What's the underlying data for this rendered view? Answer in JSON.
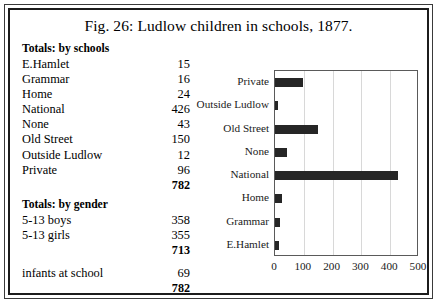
{
  "figure": {
    "title": "Fig. 26: Ludlow children in schools, 1877."
  },
  "tables": {
    "schools": {
      "heading": "Totals: by schools",
      "rows": [
        {
          "label": "E.Hamlet",
          "value": "15"
        },
        {
          "label": "Grammar",
          "value": "16"
        },
        {
          "label": "Home",
          "value": "24"
        },
        {
          "label": "National",
          "value": "426"
        },
        {
          "label": "None",
          "value": "43"
        },
        {
          "label": "Old Street",
          "value": "150"
        },
        {
          "label": "Outside Ludlow",
          "value": "12"
        },
        {
          "label": "Private",
          "value": "96"
        }
      ],
      "total": "782"
    },
    "gender": {
      "heading": "Totals: by gender",
      "rows": [
        {
          "label": "5-13 boys",
          "value": "358"
        },
        {
          "label": "5-13 girls",
          "value": "355"
        }
      ],
      "subtotal": "713",
      "extra_rows": [
        {
          "label": "infants at school",
          "value": "69"
        }
      ],
      "total": "782"
    }
  },
  "chart_data": {
    "type": "bar",
    "orientation": "horizontal",
    "title": "",
    "xlabel": "",
    "ylabel": "",
    "categories": [
      "E.Hamlet",
      "Grammar",
      "Home",
      "National",
      "None",
      "Old Street",
      "Outside Ludlow",
      "Private"
    ],
    "values": [
      15,
      16,
      24,
      426,
      43,
      150,
      12,
      96
    ],
    "category_order_top_to_bottom": [
      "Private",
      "Outside Ludlow",
      "Old Street",
      "None",
      "National",
      "Home",
      "Grammar",
      "E.Hamlet"
    ],
    "values_top_to_bottom": [
      96,
      12,
      150,
      43,
      426,
      24,
      16,
      15
    ],
    "xlim": [
      0,
      500
    ],
    "xticks": [
      "0",
      "100",
      "200",
      "300",
      "400",
      "500"
    ],
    "grid": "vertical",
    "legend": "none",
    "bar_color": "#262626"
  }
}
